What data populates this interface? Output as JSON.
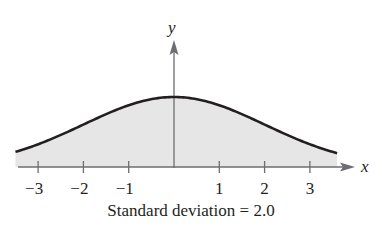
{
  "chart_data": {
    "type": "area",
    "title": "",
    "caption": "Standard deviation = 2.0",
    "xlabel": "x",
    "ylabel": "y",
    "distribution": "normal",
    "mean": 0,
    "std_dev": 2.0,
    "x_ticks": [
      -3,
      -2,
      -1,
      1,
      2,
      3
    ],
    "x_tick_labels": [
      "−3",
      "−2",
      "−1",
      "1",
      "2",
      "3"
    ],
    "xlim": [
      -3.5,
      3.6
    ],
    "peak_y": 0.1995,
    "x": [
      -3.5,
      -3,
      -2,
      -1,
      0,
      1,
      2,
      3,
      3.6
    ],
    "y": [
      0.043,
      0.065,
      0.121,
      0.176,
      0.199,
      0.176,
      0.121,
      0.065,
      0.039
    ],
    "fill_color": "#e6e6e6",
    "line_color": "#231f20",
    "grid": false,
    "legend": null
  }
}
